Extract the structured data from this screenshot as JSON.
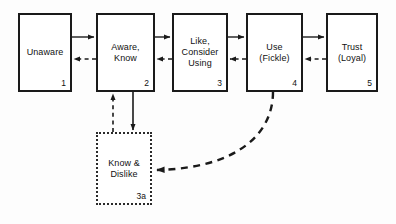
{
  "diagram": {
    "background_color": "#fdfdfd",
    "line_color": "#1a1a1a",
    "nodes": [
      {
        "id": "unaware",
        "label": "Unaware",
        "number": "1",
        "style": "solid",
        "x": 18,
        "y": 13,
        "w": 54,
        "h": 79
      },
      {
        "id": "aware-know",
        "label": "Aware,\nKnow",
        "number": "2",
        "style": "solid",
        "x": 96,
        "y": 13,
        "w": 59,
        "h": 79
      },
      {
        "id": "like-consider-using",
        "label": "Like,\nConsider\nUsing",
        "number": "3",
        "style": "solid",
        "x": 172,
        "y": 13,
        "w": 56,
        "h": 79
      },
      {
        "id": "use-fickle",
        "label": "Use\n(Fickle)",
        "number": "4",
        "style": "solid",
        "x": 246,
        "y": 13,
        "w": 57,
        "h": 79
      },
      {
        "id": "trust-loyal",
        "label": "Trust\n(Loyal)",
        "number": "5",
        "style": "solid",
        "x": 326,
        "y": 13,
        "w": 52,
        "h": 79
      },
      {
        "id": "know-dislike",
        "label": "Know &\nDislike",
        "number": "3a",
        "style": "dotted",
        "x": 96,
        "y": 132,
        "w": 56,
        "h": 73
      }
    ],
    "connections": [
      {
        "id": "unaware-to-aware",
        "from": "unaware",
        "to": "aware-know",
        "style": "solid",
        "direction": "forward"
      },
      {
        "id": "aware-to-unaware",
        "from": "aware-know",
        "to": "unaware",
        "style": "dashed",
        "direction": "backward"
      },
      {
        "id": "aware-to-like",
        "from": "aware-know",
        "to": "like-consider-using",
        "style": "solid",
        "direction": "forward"
      },
      {
        "id": "like-to-aware",
        "from": "like-consider-using",
        "to": "aware-know",
        "style": "dashed",
        "direction": "backward"
      },
      {
        "id": "like-to-use",
        "from": "like-consider-using",
        "to": "use-fickle",
        "style": "solid",
        "direction": "forward"
      },
      {
        "id": "use-to-like",
        "from": "use-fickle",
        "to": "like-consider-using",
        "style": "dashed",
        "direction": "backward"
      },
      {
        "id": "use-to-trust",
        "from": "use-fickle",
        "to": "trust-loyal",
        "style": "solid",
        "direction": "forward"
      },
      {
        "id": "trust-to-use",
        "from": "trust-loyal",
        "to": "use-fickle",
        "style": "dashed",
        "direction": "backward"
      },
      {
        "id": "aware-to-dislike",
        "from": "aware-know",
        "to": "know-dislike",
        "style": "solid",
        "direction": "down"
      },
      {
        "id": "dislike-to-aware",
        "from": "know-dislike",
        "to": "aware-know",
        "style": "dashed",
        "direction": "up"
      },
      {
        "id": "use-to-dislike",
        "from": "use-fickle",
        "to": "know-dislike",
        "style": "dashed-curve",
        "direction": "backward"
      }
    ]
  }
}
